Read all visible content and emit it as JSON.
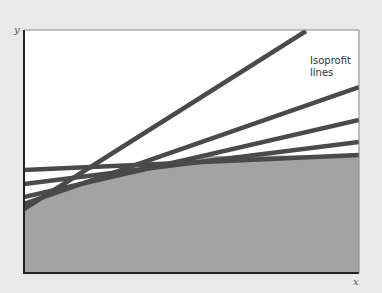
{
  "diagram": {
    "type": "isoprofit diagram",
    "axes": {
      "x_label": "x",
      "y_label": "y"
    },
    "annotation": {
      "line1": "Isoprofit",
      "line2": "lines"
    },
    "colors": {
      "background": "#e9e9e9",
      "plot_area": "#ffffff",
      "feasible_region": "#a3a3a3",
      "lines": "#4a4a4a",
      "frame": "#222222"
    },
    "frame": {
      "x": 24,
      "y": 30,
      "width": 335,
      "height": 243
    },
    "feasible_region_boundary": [
      [
        24,
        208
      ],
      [
        60,
        192
      ],
      [
        100,
        178
      ],
      [
        140,
        167
      ],
      [
        180,
        159
      ],
      [
        210,
        156
      ],
      [
        359,
        155
      ]
    ],
    "isoprofit_lines": [
      {
        "x1": 24,
        "y1": 170,
        "x2": 359,
        "y2": 155
      },
      {
        "x1": 24,
        "y1": 184,
        "x2": 359,
        "y2": 142
      },
      {
        "x1": 24,
        "y1": 197,
        "x2": 359,
        "y2": 120
      },
      {
        "x1": 24,
        "y1": 204,
        "x2": 359,
        "y2": 87
      },
      {
        "x1": 24,
        "y1": 209,
        "x2": 306,
        "y2": 31
      }
    ]
  }
}
